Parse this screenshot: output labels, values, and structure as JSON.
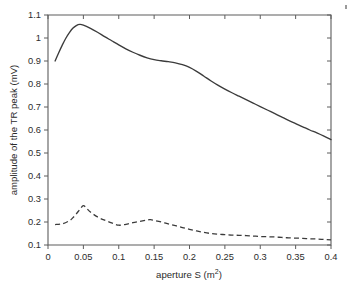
{
  "chart_data": {
    "type": "line",
    "title": "",
    "xlabel": "aperture S (m2)",
    "xlabel_base": "aperture S (m",
    "xlabel_sup": "2",
    "xlabel_tail": ")",
    "ylabel": "amplitude of the TR peak (mV)",
    "xlim": [
      0,
      0.4
    ],
    "ylim": [
      0.1,
      1.1
    ],
    "grid": false,
    "legend": "none",
    "xticks": [
      0,
      0.05,
      0.1,
      0.15,
      0.2,
      0.25,
      0.3,
      0.35,
      0.4
    ],
    "xticklabels": [
      "0",
      "0.05",
      "0.1",
      "0.15",
      "0.2",
      "0.25",
      "0.3",
      "0.35",
      "0.4"
    ],
    "yticks": [
      0.1,
      0.2,
      0.3,
      0.4,
      0.5,
      0.6,
      0.7,
      0.8,
      0.9,
      1.0,
      1.1
    ],
    "yticklabels": [
      "0.1",
      "0.2",
      "0.3",
      "0.4",
      "0.5",
      "0.6",
      "0.7",
      "0.8",
      "0.9",
      "1",
      "1.1"
    ],
    "series": [
      {
        "name": "solid-curve",
        "style": "solid",
        "color": "#3b3b3b",
        "x": [
          0.01,
          0.015,
          0.02,
          0.025,
          0.03,
          0.035,
          0.04,
          0.045,
          0.05,
          0.06,
          0.07,
          0.08,
          0.09,
          0.1,
          0.11,
          0.12,
          0.13,
          0.14,
          0.15,
          0.16,
          0.17,
          0.18,
          0.19,
          0.2,
          0.21,
          0.22,
          0.23,
          0.24,
          0.25,
          0.26,
          0.27,
          0.28,
          0.29,
          0.3,
          0.31,
          0.32,
          0.33,
          0.34,
          0.35,
          0.36,
          0.37,
          0.38,
          0.39,
          0.4
        ],
        "y": [
          0.9,
          0.935,
          0.968,
          0.998,
          1.022,
          1.042,
          1.054,
          1.059,
          1.056,
          1.042,
          1.025,
          1.006,
          0.988,
          0.97,
          0.953,
          0.938,
          0.925,
          0.914,
          0.906,
          0.901,
          0.897,
          0.892,
          0.884,
          0.872,
          0.855,
          0.835,
          0.814,
          0.795,
          0.778,
          0.762,
          0.747,
          0.732,
          0.717,
          0.702,
          0.687,
          0.672,
          0.657,
          0.642,
          0.628,
          0.614,
          0.6,
          0.587,
          0.573,
          0.558
        ]
      },
      {
        "name": "dashed-curve",
        "style": "dashed",
        "color": "#3b3b3b",
        "x": [
          0.01,
          0.02,
          0.03,
          0.035,
          0.04,
          0.045,
          0.05,
          0.055,
          0.06,
          0.07,
          0.08,
          0.09,
          0.1,
          0.11,
          0.12,
          0.13,
          0.14,
          0.145,
          0.15,
          0.16,
          0.17,
          0.18,
          0.19,
          0.2,
          0.21,
          0.22,
          0.23,
          0.24,
          0.25,
          0.26,
          0.27,
          0.28,
          0.29,
          0.3,
          0.31,
          0.32,
          0.33,
          0.34,
          0.35,
          0.36,
          0.37,
          0.38,
          0.39,
          0.4
        ],
        "y": [
          0.189,
          0.192,
          0.205,
          0.218,
          0.235,
          0.255,
          0.271,
          0.258,
          0.243,
          0.222,
          0.208,
          0.196,
          0.186,
          0.19,
          0.197,
          0.203,
          0.209,
          0.21,
          0.207,
          0.2,
          0.192,
          0.184,
          0.176,
          0.168,
          0.161,
          0.155,
          0.15,
          0.147,
          0.145,
          0.143,
          0.142,
          0.141,
          0.139,
          0.137,
          0.136,
          0.135,
          0.133,
          0.131,
          0.13,
          0.129,
          0.127,
          0.126,
          0.124,
          0.122
        ]
      }
    ]
  },
  "plot_geometry": {
    "left": 48,
    "right": 331,
    "top": 15,
    "bottom": 245
  }
}
